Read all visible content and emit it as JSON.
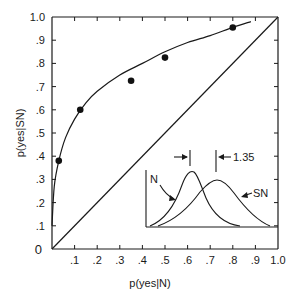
{
  "chart_data": {
    "type": "scatter",
    "title": "",
    "xlabel": "p(yes|N)",
    "ylabel": "p(yes|SN)",
    "xlim": [
      0,
      1.0
    ],
    "ylim": [
      0,
      1.0
    ],
    "grid": false,
    "legend": null,
    "x_ticks": [
      "0",
      ".1",
      ".2",
      ".3",
      ".4",
      ".5",
      ".6",
      ".7",
      ".8",
      ".9",
      "1.0"
    ],
    "y_ticks": [
      "0",
      ".1",
      ".2",
      ".3",
      ".4",
      ".5",
      ".6",
      ".7",
      ".8",
      ".9",
      "1.0"
    ],
    "series": [
      {
        "name": "observed points",
        "kind": "scatter",
        "x": [
          0.03,
          0.125,
          0.35,
          0.5,
          0.8
        ],
        "y": [
          0.38,
          0.6,
          0.725,
          0.825,
          0.955
        ]
      },
      {
        "name": "fitted ROC curve",
        "kind": "line",
        "x": [
          0.0,
          0.01,
          0.03,
          0.06,
          0.1,
          0.15,
          0.2,
          0.3,
          0.4,
          0.5,
          0.6,
          0.7,
          0.8,
          0.88
        ],
        "y": [
          0.1,
          0.27,
          0.38,
          0.48,
          0.56,
          0.63,
          0.68,
          0.75,
          0.8,
          0.85,
          0.89,
          0.92,
          0.955,
          0.98
        ]
      },
      {
        "name": "chance diagonal",
        "kind": "line",
        "x": [
          0,
          1.0
        ],
        "y": [
          0,
          1.0
        ]
      }
    ],
    "inset": {
      "description": "Two overlapping normal distributions (N and SN)",
      "labels": {
        "noise": "N",
        "signal_noise": "SN",
        "separation": "1.35"
      },
      "noise_peak_x_rel": 0.34,
      "sn_peak_x_rel": 0.53
    }
  }
}
